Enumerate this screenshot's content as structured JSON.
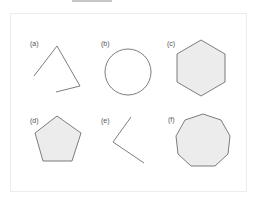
{
  "figure": {
    "colors": {
      "stroke": "#6e6e6e",
      "fill": "#ececec",
      "frame": "#ececec",
      "topbar": "#c8c8c8"
    },
    "panels": [
      {
        "id": "a",
        "label": "(a)",
        "shape": "open-polyline",
        "label_pos": [
          30,
          40
        ],
        "points": "34,76 57,46 80,86 56,92",
        "filled": false
      },
      {
        "id": "b",
        "label": "(b)",
        "shape": "circle",
        "label_pos": [
          101,
          40
        ],
        "cx": 128,
        "cy": 72,
        "r": 23,
        "filled": false
      },
      {
        "id": "c",
        "label": "(c)",
        "shape": "hexagon",
        "label_pos": [
          167,
          40
        ],
        "points": "201,40 225,54 225,82 201,96 177,82 177,54",
        "filled": true
      },
      {
        "id": "d",
        "label": "(d)",
        "shape": "pentagon",
        "label_pos": [
          30,
          117
        ],
        "points": "57,116 81,133 72,161 43,161 35,133",
        "filled": true
      },
      {
        "id": "e",
        "label": "(e)",
        "shape": "open-polyline",
        "label_pos": [
          101,
          117
        ],
        "points": "131,117 113,142 144,163",
        "filled": false
      },
      {
        "id": "f",
        "label": "(f)",
        "shape": "nonagon",
        "label_pos": [
          168,
          116
        ],
        "points": "203,114 221,120 230,136 228,154 215,166 191,166 178,154 176,136 185,120",
        "filled": true
      }
    ]
  }
}
